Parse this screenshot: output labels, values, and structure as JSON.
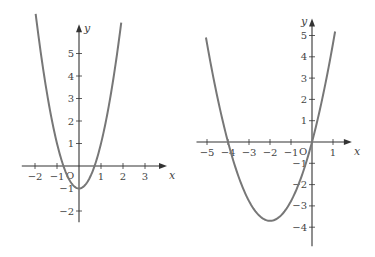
{
  "graphs": [
    {
      "name": "left-graph",
      "function": "y = 2x^2 - 1",
      "coeffs": {
        "a": 2,
        "b": 0,
        "c": -1
      },
      "x_range": [
        -1.97,
        1.92
      ],
      "x_axis_label": "x",
      "y_axis_label": "y",
      "origin_label": "O",
      "x_ticks": [
        -2,
        -1,
        1,
        2,
        3
      ],
      "x_tick_labels": [
        "−2",
        "−1",
        "1",
        "2",
        "3"
      ],
      "y_ticks": [
        -2,
        -1,
        1,
        2,
        3,
        4,
        5
      ],
      "y_tick_labels": [
        "−2",
        "−1",
        "1",
        "2",
        "3",
        "4",
        "5"
      ],
      "x_axis_extent": [
        -2.6,
        4.0
      ],
      "y_axis_extent": [
        -2.5,
        6.3
      ]
    },
    {
      "name": "right-graph",
      "function": "y = 0.925x^2 + 3.7x",
      "coeffs": {
        "a": 0.925,
        "b": 3.7,
        "c": 0
      },
      "x_range": [
        -5.05,
        1.1
      ],
      "x_axis_label": "x",
      "y_axis_label": "y",
      "origin_label": "O",
      "x_ticks": [
        -5,
        -4,
        -3,
        -2,
        -1,
        1
      ],
      "x_tick_labels": [
        "−5",
        "−4",
        "−3",
        "−2",
        "−1",
        "1"
      ],
      "y_ticks": [
        -4,
        -3,
        -2,
        -1,
        1,
        2,
        3,
        4,
        5
      ],
      "y_tick_labels": [
        "−4",
        "−3",
        "−2",
        "−1",
        "1",
        "2",
        "3",
        "4",
        "5"
      ],
      "x_axis_extent": [
        -5.5,
        1.9
      ],
      "y_axis_extent": [
        -4.9,
        5.8
      ]
    }
  ]
}
